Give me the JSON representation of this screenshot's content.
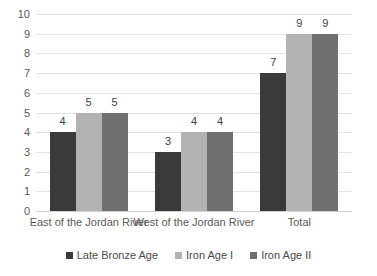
{
  "chart_data": {
    "type": "bar",
    "title": "",
    "subtitle": "",
    "xlabel": "",
    "ylabel": "",
    "categories": [
      "East of the Jordan River",
      "West of the Jordan River",
      "Total"
    ],
    "series": [
      {
        "name": "Late Bronze Age",
        "values": [
          4,
          3,
          7
        ],
        "color": "#3a3a3a"
      },
      {
        "name": "Iron Age I",
        "values": [
          5,
          4,
          9
        ],
        "color": "#b3b3b3"
      },
      {
        "name": "Iron Age II",
        "values": [
          5,
          4,
          9
        ],
        "color": "#707070"
      }
    ],
    "ylim": [
      0,
      10
    ],
    "ytick_labels": [
      "10",
      "9",
      "8",
      "7",
      "6",
      "5",
      "4",
      "3",
      "2",
      "1",
      "0"
    ],
    "ytick_values": [
      10,
      9,
      8,
      7,
      6,
      5,
      4,
      3,
      2,
      1,
      0
    ],
    "grid": true,
    "grid_axis": "y",
    "legend_position": "bottom",
    "data_labels": true,
    "background_color": "#ffffff",
    "gridline_color": "#e4e4e4"
  }
}
